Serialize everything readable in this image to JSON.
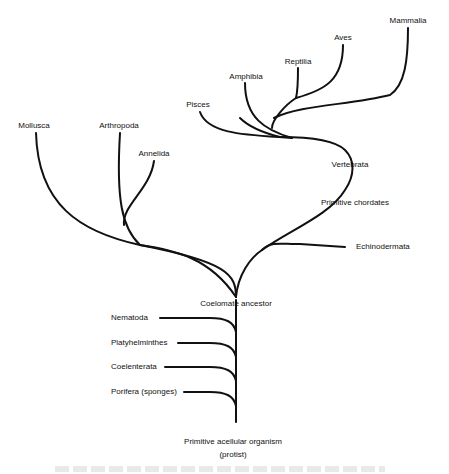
{
  "diagram": {
    "type": "phylogenetic-tree",
    "root": "Primitive acellular organism (protist)",
    "labels": {
      "mammalia": "Mammalia",
      "aves": "Aves",
      "reptilia": "Reptilia",
      "amphibia": "Amphibia",
      "pisces": "Pisces",
      "mollusca": "Mollusca",
      "arthropoda": "Arthropoda",
      "annelida": "Annelida",
      "vertebrata": "Vertebrata",
      "primitive_chordates": "Primitive chordates",
      "echinodermata": "Echinodermata",
      "coelomate_ancestor": "Coelomate ancestor",
      "nematoda": "Nematoda",
      "platyhelminthes": "Platyhelminthes",
      "coelenterata": "Coelenterata",
      "porifera": "Porifera (sponges)",
      "root_line1": "Primitive acellular organism",
      "root_line2": "(protist)"
    },
    "nodes": [
      {
        "name": "Primitive acellular organism (protist)",
        "parent": null
      },
      {
        "name": "Porifera (sponges)",
        "parent": "Primitive acellular organism (protist)"
      },
      {
        "name": "Coelenterata",
        "parent": "Primitive acellular organism (protist)"
      },
      {
        "name": "Platyhelminthes",
        "parent": "Primitive acellular organism (protist)"
      },
      {
        "name": "Nematoda",
        "parent": "Primitive acellular organism (protist)"
      },
      {
        "name": "Coelomate ancestor",
        "parent": "Primitive acellular organism (protist)"
      },
      {
        "name": "Mollusca",
        "parent": "Coelomate ancestor"
      },
      {
        "name": "Arthropoda",
        "parent": "Coelomate ancestor"
      },
      {
        "name": "Annelida",
        "parent": "Coelomate ancestor"
      },
      {
        "name": "Echinodermata",
        "parent": "Coelomate ancestor"
      },
      {
        "name": "Primitive chordates",
        "parent": "Coelomate ancestor"
      },
      {
        "name": "Vertebrata",
        "parent": "Primitive chordates"
      },
      {
        "name": "Pisces",
        "parent": "Vertebrata"
      },
      {
        "name": "Amphibia",
        "parent": "Vertebrata"
      },
      {
        "name": "Reptilia",
        "parent": "Vertebrata"
      },
      {
        "name": "Aves",
        "parent": "Vertebrata"
      },
      {
        "name": "Mammalia",
        "parent": "Vertebrata"
      }
    ],
    "colors": {
      "line": "#111111",
      "text": "#111111",
      "background": "#ffffff"
    }
  }
}
